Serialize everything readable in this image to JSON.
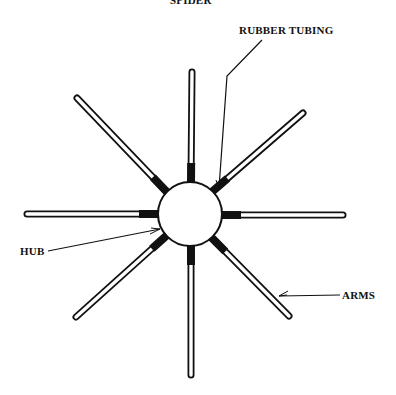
{
  "title": "SPIDER",
  "labels": {
    "rubber_tubing": "RUBBER TUBING",
    "hub": "HUB",
    "arms": "ARMS"
  },
  "colors": {
    "background": "#ffffff",
    "ink": "#111111",
    "tube_fill": "#ffffff"
  },
  "hub": {
    "cx": 190,
    "cy": 214,
    "r": 32
  },
  "arms": [
    {
      "name": "top",
      "x1": 191,
      "y1": 182,
      "x2": 192,
      "y2": 72
    },
    {
      "name": "upper-right",
      "x1": 213,
      "y1": 191,
      "x2": 303,
      "y2": 113
    },
    {
      "name": "right",
      "x1": 222,
      "y1": 215,
      "x2": 343,
      "y2": 215
    },
    {
      "name": "lower-right",
      "x1": 212,
      "y1": 238,
      "x2": 289,
      "y2": 316
    },
    {
      "name": "bottom",
      "x1": 191,
      "y1": 246,
      "x2": 191,
      "y2": 375
    },
    {
      "name": "lower-left",
      "x1": 166,
      "y1": 236,
      "x2": 76,
      "y2": 317
    },
    {
      "name": "left",
      "x1": 158,
      "y1": 214,
      "x2": 27,
      "y2": 214
    },
    {
      "name": "upper-left",
      "x1": 166,
      "y1": 191,
      "x2": 77,
      "y2": 98
    }
  ],
  "tubing_length": 19
}
